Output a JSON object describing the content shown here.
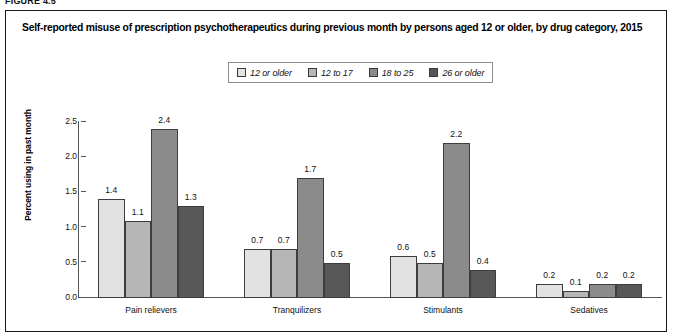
{
  "figure": {
    "number_label": "FIGURE 4.5",
    "title": "Self-reported misuse of prescription psychotherapeutics during previous month by persons aged 12 or older, by drug category, 2015"
  },
  "chart_data": {
    "type": "bar",
    "title": "Self-reported misuse of prescription psychotherapeutics during previous month by persons aged 12 or older, by drug category, 2015",
    "xlabel": "",
    "ylabel": "Percent using in past month",
    "ylim": [
      0.0,
      2.5
    ],
    "ytick_labels": [
      "0.0",
      "0.5",
      "1.0",
      "1.5",
      "2.0",
      "2.5"
    ],
    "ytick_values": [
      0.0,
      0.5,
      1.0,
      1.5,
      2.0,
      2.5
    ],
    "grid": false,
    "legend_position": "top-center",
    "categories": [
      "Pain relievers",
      "Tranquilizers",
      "Stimulants",
      "Sedatives"
    ],
    "series": [
      {
        "name": "12 or older",
        "color": "#e2e2e2",
        "values": [
          1.4,
          0.7,
          0.6,
          0.2
        ],
        "labels": [
          "1.4",
          "0.7",
          "0.6",
          "0.2"
        ]
      },
      {
        "name": "12 to 17",
        "color": "#b6b6b6",
        "values": [
          1.1,
          0.7,
          0.5,
          0.1
        ],
        "labels": [
          "1.1",
          "0.7",
          "0.5",
          "0.1"
        ]
      },
      {
        "name": "18 to 25",
        "color": "#8b8b8b",
        "values": [
          2.4,
          1.7,
          2.2,
          0.2
        ],
        "labels": [
          "2.4",
          "1.7",
          "2.2",
          "0.2"
        ]
      },
      {
        "name": "26 or older",
        "color": "#575757",
        "values": [
          1.3,
          0.5,
          0.4,
          0.2
        ],
        "labels": [
          "1.3",
          "0.5",
          "0.4",
          "0.2"
        ]
      }
    ]
  }
}
